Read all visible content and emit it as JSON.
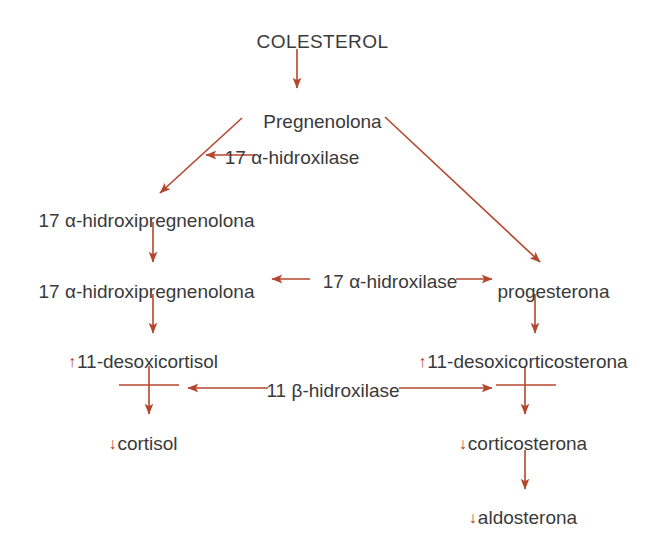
{
  "diagram": {
    "colors": {
      "arrow": "#b5462e",
      "text": "#3a3a3a",
      "background": "#ffffff",
      "regulation_marker": "#b5462e"
    },
    "nodes": [
      {
        "id": "colesterol",
        "label": "COLESTEROL",
        "marker": "",
        "x": 322,
        "y": 32,
        "align": "center"
      },
      {
        "id": "pregnenolona",
        "label": "Pregnenolona",
        "marker": "",
        "x": 322,
        "y": 112,
        "align": "center"
      },
      {
        "id": "17a-hidroxipregnenolona-1",
        "label": "17 α-hidroxipregnenolona",
        "marker": "",
        "x": 146,
        "y": 211,
        "align": "center"
      },
      {
        "id": "17a-hidroxipregnenolona-2",
        "label": "17 α-hidroxipregnenolona",
        "marker": "",
        "x": 146,
        "y": 282,
        "align": "center"
      },
      {
        "id": "progesterona",
        "label": "progesterona",
        "marker": "",
        "x": 553,
        "y": 282,
        "align": "center"
      },
      {
        "id": "11-desoxicortisol",
        "label": "11-desoxicortisol",
        "marker": "↑",
        "x": 143,
        "y": 352,
        "align": "center"
      },
      {
        "id": "11-desoxicorticosterona",
        "label": "11-desoxicorticosterona",
        "marker": "↑",
        "x": 523,
        "y": 352,
        "align": "center"
      },
      {
        "id": "cortisol",
        "label": "cortisol",
        "marker": "↓",
        "x": 143,
        "y": 434,
        "align": "center"
      },
      {
        "id": "corticosterona",
        "label": "corticosterona",
        "marker": "↓",
        "x": 523,
        "y": 434,
        "align": "center"
      },
      {
        "id": "aldosterona",
        "label": "aldosterona",
        "marker": "↓",
        "x": 523,
        "y": 508,
        "align": "center"
      }
    ],
    "enzymes": [
      {
        "id": "17a-hidroxilase-top",
        "label": "17 α-hidroxilase",
        "x": 292,
        "y": 158
      },
      {
        "id": "17a-hidroxilase-middle",
        "label": "17 α-hidroxilase",
        "x": 390,
        "y": 282
      },
      {
        "id": "11b-hidroxilase",
        "label": "11 β-hidroxilase",
        "x": 333,
        "y": 392
      }
    ],
    "edges": [
      {
        "id": "colesterol-to-pregnenolona",
        "from": "colesterol",
        "to": "pregnenolona",
        "type": "vertical",
        "blocked": false
      },
      {
        "id": "pregnenolona-to-17a-hidroxipregnenolona",
        "from": "pregnenolona",
        "to": "17a-hidroxipregnenolona-1",
        "type": "diagonal-left",
        "blocked": false
      },
      {
        "id": "pregnenolona-to-progesterona",
        "from": "pregnenolona",
        "to": "progesterona",
        "type": "diagonal-right",
        "blocked": false
      },
      {
        "id": "17a-hidroxipregnenolona-chain",
        "from": "17a-hidroxipregnenolona-1",
        "to": "17a-hidroxipregnenolona-2",
        "type": "vertical",
        "blocked": false
      },
      {
        "id": "17a-hidroxipregnenolona-to-11-desoxicortisol",
        "from": "17a-hidroxipregnenolona-2",
        "to": "11-desoxicortisol",
        "type": "vertical",
        "blocked": false
      },
      {
        "id": "progesterona-to-11-desoxicorticosterona",
        "from": "progesterona",
        "to": "11-desoxicorticosterona",
        "type": "vertical",
        "blocked": false
      },
      {
        "id": "11-desoxicortisol-to-cortisol",
        "from": "11-desoxicortisol",
        "to": "cortisol",
        "type": "vertical",
        "blocked": true
      },
      {
        "id": "11-desoxicorticosterona-to-corticosterona",
        "from": "11-desoxicorticosterona",
        "to": "corticosterona",
        "type": "vertical",
        "blocked": true
      },
      {
        "id": "corticosterona-to-aldosterona",
        "from": "corticosterona",
        "to": "aldosterona",
        "type": "vertical",
        "blocked": false
      }
    ],
    "legend_markers": {
      "increased": "↑",
      "decreased": "↓"
    }
  }
}
